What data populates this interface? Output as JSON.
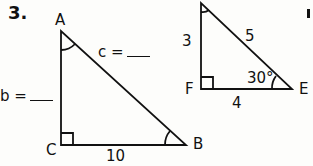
{
  "problem": {
    "number": "3.",
    "triangle_left": {
      "vertices": {
        "A": "A",
        "B": "B",
        "C": "C"
      },
      "right_angle_at": "C",
      "marked_angles": [
        "A",
        "B"
      ],
      "sides": {
        "c_label": "c =",
        "b_label": "b =",
        "a_value": "10"
      }
    },
    "triangle_right": {
      "vertices": {
        "F": "F",
        "E": "E"
      },
      "right_angle_at": "F",
      "marked_angles": [
        "top",
        "E"
      ],
      "sides": {
        "vertical": "3",
        "hypotenuse": "5",
        "horizontal": "4"
      },
      "angle_E": "30°"
    }
  },
  "colors": {
    "ink": "#111111",
    "paper": "#fdfdfb"
  }
}
